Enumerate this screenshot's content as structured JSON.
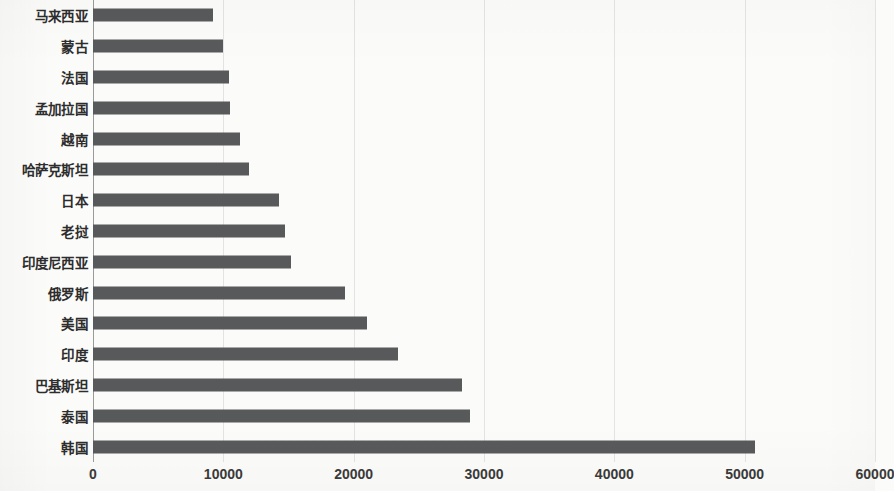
{
  "chart_data": {
    "type": "bar",
    "orientation": "horizontal",
    "title": "",
    "subtitle": "",
    "xlabel": "",
    "ylabel": "",
    "xlim": [
      0,
      60000
    ],
    "xticks": [
      0,
      10000,
      20000,
      30000,
      40000,
      50000,
      60000
    ],
    "xtick_labels": [
      "0",
      "10000",
      "20000",
      "30000",
      "40000",
      "50000",
      "60000"
    ],
    "grid": true,
    "grid_axis": "x",
    "legend": false,
    "legend_position": "none",
    "bar_color": "#58595b",
    "background_color": "#fbfbf9",
    "gridline_color": "#e3e3e1",
    "axis_color": "#9a9a98",
    "categories": [
      "马来西亚",
      "蒙古",
      "法国",
      "孟加拉国",
      "越南",
      "哈萨克斯坦",
      "日本",
      "老挝",
      "印度尼西亚",
      "俄罗斯",
      "美国",
      "印度",
      "巴基斯坦",
      "泰国",
      "韩国"
    ],
    "values": [
      9200,
      10000,
      10400,
      10500,
      11300,
      12000,
      14300,
      14700,
      15200,
      19300,
      21000,
      23400,
      28300,
      28900,
      50800
    ]
  }
}
